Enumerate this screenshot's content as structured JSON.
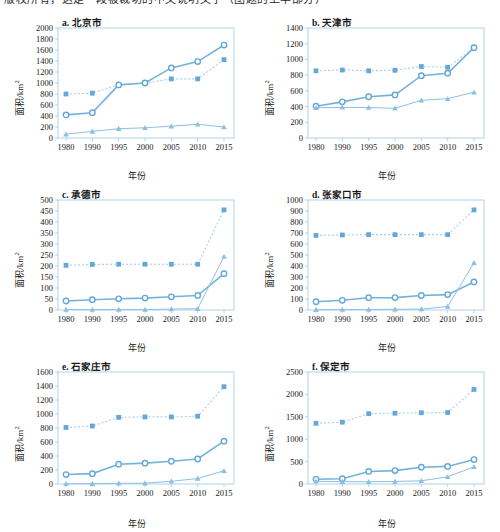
{
  "top_caption": "版权所有，这是一段被裁切的中文说明文字（图题的上半部分）",
  "figure": {
    "xlabel": "年份",
    "ylabel": "面积/km",
    "ylabel_sup": "2",
    "xticks": [
      1980,
      1990,
      1995,
      2000,
      2005,
      2010,
      2015
    ]
  },
  "colors": {
    "series_square": "#64a8d8",
    "series_circle": "#74b2dc",
    "series_triangle": "#8cc0e2",
    "frame": "#9ec9e6"
  },
  "chart_data": [
    {
      "type": "line",
      "panel": "a",
      "title": "a. 北京市",
      "xlabel": "年份",
      "ylabel": "面积/km²",
      "x": [
        1980,
        1990,
        1995,
        2000,
        2005,
        2010,
        2015
      ],
      "ylim": [
        0,
        2000
      ],
      "ytick_step": 200,
      "yticks": [
        0,
        200,
        400,
        600,
        800,
        1000,
        1200,
        1400,
        1600,
        1800,
        2000
      ],
      "grid": false,
      "legend": "none",
      "series": [
        {
          "name": "square-dotted",
          "marker": "square",
          "linestyle": "dotted",
          "values": [
            800,
            815,
            965,
            1000,
            1075,
            1075,
            1425
          ]
        },
        {
          "name": "circle-solid",
          "marker": "circle",
          "linestyle": "solid",
          "values": [
            420,
            460,
            965,
            1000,
            1275,
            1390,
            1690
          ]
        },
        {
          "name": "triangle-solid",
          "marker": "triangle",
          "linestyle": "solid",
          "values": [
            70,
            120,
            170,
            185,
            215,
            250,
            200
          ]
        }
      ]
    },
    {
      "type": "line",
      "panel": "b",
      "title": "b. 天津市",
      "xlabel": "年份",
      "ylabel": "面积/km²",
      "x": [
        1980,
        1990,
        1995,
        2000,
        2005,
        2010,
        2015
      ],
      "ylim": [
        0,
        1400
      ],
      "ytick_step": 200,
      "yticks": [
        0,
        200,
        400,
        600,
        800,
        1000,
        1200,
        1400
      ],
      "grid": false,
      "legend": "none",
      "series": [
        {
          "name": "square-dotted",
          "marker": "square",
          "linestyle": "dotted",
          "values": [
            855,
            865,
            855,
            862,
            910,
            900,
            1150
          ]
        },
        {
          "name": "circle-solid",
          "marker": "circle",
          "linestyle": "solid",
          "values": [
            405,
            460,
            525,
            548,
            793,
            825,
            1150
          ]
        },
        {
          "name": "triangle-solid",
          "marker": "triangle",
          "linestyle": "solid",
          "values": [
            385,
            390,
            388,
            378,
            480,
            500,
            583
          ]
        }
      ]
    },
    {
      "type": "line",
      "panel": "c",
      "title": "c. 承德市",
      "xlabel": "年份",
      "ylabel": "面积/km²",
      "x": [
        1980,
        1990,
        1995,
        2000,
        2005,
        2010,
        2015
      ],
      "ylim": [
        0,
        500
      ],
      "ytick_step": 50,
      "yticks": [
        0,
        50,
        100,
        150,
        200,
        250,
        300,
        350,
        400,
        450,
        500
      ],
      "grid": false,
      "legend": "none",
      "series": [
        {
          "name": "square-dotted",
          "marker": "square",
          "linestyle": "dotted",
          "values": [
            203,
            207,
            208,
            208,
            208,
            208,
            455
          ]
        },
        {
          "name": "circle-solid",
          "marker": "circle",
          "linestyle": "solid",
          "values": [
            41,
            47,
            51,
            54,
            60,
            66,
            165
          ]
        },
        {
          "name": "triangle-solid",
          "marker": "triangle",
          "linestyle": "solid",
          "values": [
            2,
            2,
            2,
            2,
            4,
            6,
            243
          ]
        }
      ]
    },
    {
      "type": "line",
      "panel": "d",
      "title": "d. 张家口市",
      "xlabel": "年份",
      "ylabel": "面积/km²",
      "x": [
        1980,
        1990,
        1995,
        2000,
        2005,
        2010,
        2015
      ],
      "ylim": [
        0,
        1000
      ],
      "ytick_step": 100,
      "yticks": [
        0,
        100,
        200,
        300,
        400,
        500,
        600,
        700,
        800,
        900,
        1000
      ],
      "grid": false,
      "legend": "none",
      "series": [
        {
          "name": "square-dotted",
          "marker": "square",
          "linestyle": "dotted",
          "values": [
            678,
            682,
            685,
            685,
            685,
            685,
            910
          ]
        },
        {
          "name": "circle-solid",
          "marker": "circle",
          "linestyle": "solid",
          "values": [
            75,
            88,
            112,
            113,
            132,
            140,
            255
          ]
        },
        {
          "name": "triangle-solid",
          "marker": "triangle",
          "linestyle": "solid",
          "values": [
            3,
            4,
            5,
            6,
            8,
            32,
            430
          ]
        }
      ]
    },
    {
      "type": "line",
      "panel": "e",
      "title": "e. 石家庄市",
      "xlabel": "年份",
      "ylabel": "面积/km²",
      "x": [
        1980,
        1990,
        1995,
        2000,
        2005,
        2010,
        2015
      ],
      "ylim": [
        0,
        1600
      ],
      "ytick_step": 200,
      "yticks": [
        0,
        200,
        400,
        600,
        800,
        1000,
        1200,
        1400,
        1600
      ],
      "grid": false,
      "legend": "none",
      "series": [
        {
          "name": "square-dotted",
          "marker": "square",
          "linestyle": "dotted",
          "values": [
            808,
            828,
            952,
            958,
            958,
            968,
            1390
          ]
        },
        {
          "name": "circle-solid",
          "marker": "circle",
          "linestyle": "solid",
          "values": [
            135,
            148,
            283,
            298,
            325,
            357,
            612
          ]
        },
        {
          "name": "triangle-solid",
          "marker": "triangle",
          "linestyle": "solid",
          "values": [
            3,
            5,
            10,
            12,
            38,
            78,
            190
          ]
        }
      ]
    },
    {
      "type": "line",
      "panel": "f",
      "title": "f. 保定市",
      "xlabel": "年份",
      "ylabel": "面积/km²",
      "x": [
        1980,
        1990,
        1995,
        2000,
        2005,
        2010,
        2015
      ],
      "ylim": [
        0,
        2500
      ],
      "ytick_step": 500,
      "yticks": [
        0,
        500,
        1000,
        1500,
        2000,
        2500
      ],
      "grid": false,
      "legend": "none",
      "series": [
        {
          "name": "square-dotted",
          "marker": "square",
          "linestyle": "dotted",
          "values": [
            1355,
            1380,
            1570,
            1580,
            1590,
            1595,
            2110
          ]
        },
        {
          "name": "circle-solid",
          "marker": "circle",
          "linestyle": "solid",
          "values": [
            105,
            118,
            280,
            300,
            375,
            392,
            545
          ]
        },
        {
          "name": "triangle-solid",
          "marker": "triangle",
          "linestyle": "solid",
          "values": [
            60,
            52,
            50,
            58,
            72,
            160,
            385
          ]
        }
      ]
    }
  ]
}
